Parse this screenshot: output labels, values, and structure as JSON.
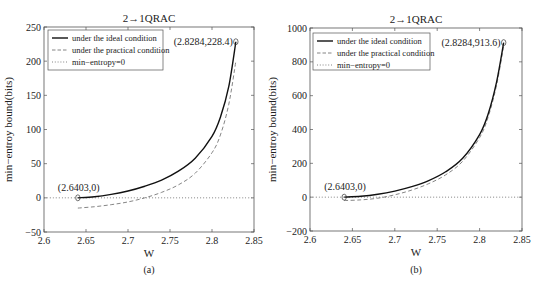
{
  "chart_data": [
    {
      "type": "line",
      "panel": "a",
      "caption": "(a)",
      "title": "2→1QRAC",
      "xlabel": "W",
      "ylabel": "min−entroy bound(bits)",
      "xlim": [
        2.6,
        2.85
      ],
      "ylim": [
        -50,
        250
      ],
      "xticks": [
        2.6,
        2.65,
        2.7,
        2.75,
        2.8,
        2.85
      ],
      "xtick_labels": [
        "2.6",
        "2.65",
        "2.7",
        "2.75",
        "2.8",
        "2.85"
      ],
      "yticks": [
        -50,
        0,
        50,
        100,
        150,
        200,
        250
      ],
      "ytick_labels": [
        "−50",
        "0",
        "50",
        "100",
        "150",
        "200",
        "250"
      ],
      "legend_position": "top-left",
      "series": [
        {
          "name": "under the ideal condition",
          "style": "solid",
          "color": "#111111",
          "x": [
            2.6403,
            2.66,
            2.68,
            2.7,
            2.72,
            2.74,
            2.76,
            2.78,
            2.8,
            2.81,
            2.82,
            2.8284
          ],
          "y": [
            0,
            1.5,
            5,
            10,
            17,
            26,
            39,
            58,
            90,
            118,
            163,
            228.4
          ]
        },
        {
          "name": "under the practical condition",
          "style": "dashed",
          "color": "#777777",
          "x": [
            2.6403,
            2.66,
            2.68,
            2.7,
            2.72,
            2.74,
            2.76,
            2.78,
            2.8,
            2.81,
            2.82,
            2.8284
          ],
          "y": [
            -15,
            -13,
            -10,
            -6,
            0,
            8,
            19,
            36,
            66,
            92,
            137,
            200
          ]
        },
        {
          "name": "min−entropy=0",
          "style": "dotted",
          "color": "#777777",
          "x": [
            2.6,
            2.85
          ],
          "y": [
            0,
            0
          ]
        }
      ],
      "annotations": [
        {
          "text": "(2.6403,0)",
          "x": 2.6403,
          "y": 0,
          "marker": "o"
        },
        {
          "text": "(2.8284,228.4)",
          "x": 2.8284,
          "y": 228.4,
          "marker": "o"
        }
      ]
    },
    {
      "type": "line",
      "panel": "b",
      "caption": "(b)",
      "title": "2→1QRAC",
      "xlabel": "W",
      "ylabel": "min−entroy bound(bits)",
      "xlim": [
        2.6,
        2.85
      ],
      "ylim": [
        -200,
        1000
      ],
      "xticks": [
        2.6,
        2.65,
        2.7,
        2.75,
        2.8,
        2.85
      ],
      "xtick_labels": [
        "2.6",
        "2.65",
        "2.7",
        "2.75",
        "2.8",
        "2.85"
      ],
      "yticks": [
        -200,
        0,
        200,
        400,
        600,
        800,
        1000
      ],
      "ytick_labels": [
        "−200",
        "0",
        "200",
        "400",
        "600",
        "800",
        "1000"
      ],
      "legend_position": "top-left",
      "series": [
        {
          "name": "under the ideal condition",
          "style": "solid",
          "color": "#111111",
          "x": [
            2.6403,
            2.66,
            2.68,
            2.7,
            2.72,
            2.74,
            2.76,
            2.78,
            2.8,
            2.81,
            2.82,
            2.8284
          ],
          "y": [
            0,
            5,
            17,
            36,
            62,
            98,
            150,
            230,
            370,
            490,
            680,
            913.6
          ]
        },
        {
          "name": "under the practical condition",
          "style": "dashed",
          "color": "#777777",
          "x": [
            2.6403,
            2.66,
            2.68,
            2.7,
            2.72,
            2.74,
            2.76,
            2.78,
            2.8,
            2.81,
            2.82,
            2.8284
          ],
          "y": [
            -20,
            -16,
            -6,
            14,
            42,
            80,
            132,
            212,
            352,
            472,
            662,
            895
          ]
        },
        {
          "name": "min−entropy=0",
          "style": "dotted",
          "color": "#777777",
          "x": [
            2.6,
            2.85
          ],
          "y": [
            0,
            0
          ]
        }
      ],
      "annotations": [
        {
          "text": "(2.6403,0)",
          "x": 2.6403,
          "y": 0,
          "marker": "o"
        },
        {
          "text": "(2.8284,913.6)",
          "x": 2.8284,
          "y": 913.6,
          "marker": "o"
        }
      ]
    }
  ]
}
